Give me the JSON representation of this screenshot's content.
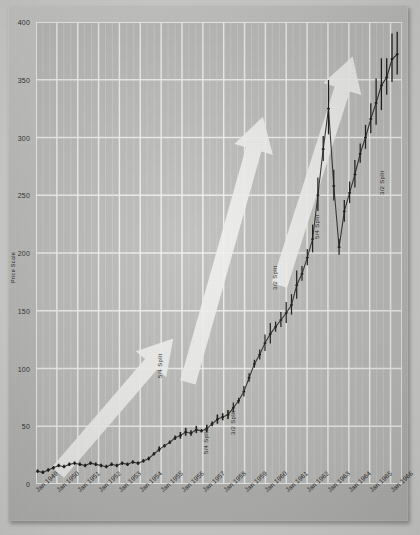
{
  "chart_data": {
    "type": "line",
    "title": "",
    "subtitle": "",
    "xlabel": "",
    "ylabel": "Price Scale",
    "ylim": [
      0,
      400
    ],
    "xlim": [
      "Jan 1949",
      "Jan 1966"
    ],
    "grid": true,
    "legend": "none",
    "y_ticks": [
      0,
      50,
      100,
      150,
      200,
      250,
      300,
      350,
      400
    ],
    "y_tick_labels": [
      "0",
      "50",
      "100",
      "150",
      "200",
      "250",
      "300",
      "350",
      "400"
    ],
    "x_ticks": [
      "Jan 1949",
      "Jan 1950",
      "Jan 1951",
      "Jan 1952",
      "Jan 1953",
      "Jan 1954",
      "Jan 1955",
      "Jan 1956",
      "Jan 1957",
      "Jan 1958",
      "Jan 1959",
      "Jan 1960",
      "Jan 1961",
      "Jan 1962",
      "Jan 1963",
      "Jan 1964",
      "Jan 1965",
      "Jan 1966"
    ],
    "annotations": [
      {
        "text": "5/4 Split",
        "x_frac": 0.33,
        "y_frac": 0.77,
        "rotation": -90
      },
      {
        "text": "5/4 Split",
        "x_frac": 0.455,
        "y_frac": 0.935,
        "rotation": -90
      },
      {
        "text": "3/2 Split",
        "x_frac": 0.53,
        "y_frac": 0.895,
        "rotation": -90
      },
      {
        "text": "3/2 Split",
        "x_frac": 0.645,
        "y_frac": 0.58,
        "rotation": -90
      },
      {
        "text": "5/4 Split",
        "x_frac": 0.76,
        "y_frac": 0.47,
        "rotation": -90
      },
      {
        "text": "3/2 Split",
        "x_frac": 0.938,
        "y_frac": 0.375,
        "rotation": -90
      }
    ],
    "overlays": [
      {
        "name": "trend-arrow-1",
        "shape": "arrow",
        "color": "#f2f2f0",
        "from_frac": [
          0.06,
          0.975
        ],
        "to_frac": [
          0.375,
          0.685
        ]
      },
      {
        "name": "trend-arrow-2",
        "shape": "arrow",
        "color": "#f2f2f0",
        "from_frac": [
          0.415,
          0.78
        ],
        "to_frac": [
          0.62,
          0.205
        ]
      },
      {
        "name": "trend-arrow-3",
        "shape": "arrow",
        "color": "#f2f2f0",
        "from_frac": [
          0.665,
          0.57
        ],
        "to_frac": [
          0.865,
          0.075
        ]
      }
    ],
    "series": [
      {
        "name": "Price",
        "style": "ohlc-bars",
        "color": "#141414",
        "x": [
          "Jan 1949",
          "Apr 1949",
          "Jul 1949",
          "Oct 1949",
          "Jan 1950",
          "Apr 1950",
          "Jul 1950",
          "Oct 1950",
          "Jan 1951",
          "Apr 1951",
          "Jul 1951",
          "Oct 1951",
          "Jan 1952",
          "Apr 1952",
          "Jul 1952",
          "Oct 1952",
          "Jan 1953",
          "Apr 1953",
          "Jul 1953",
          "Oct 1953",
          "Jan 1954",
          "Apr 1954",
          "Jul 1954",
          "Oct 1954",
          "Jan 1955",
          "Apr 1955",
          "Jul 1955",
          "Oct 1955",
          "Jan 1956",
          "Apr 1956",
          "Jul 1956",
          "Oct 1956",
          "Jan 1957",
          "Apr 1957",
          "Jul 1957",
          "Oct 1957",
          "Jan 1958",
          "Apr 1958",
          "Jul 1958",
          "Oct 1958",
          "Jan 1959",
          "Apr 1959",
          "Jul 1959",
          "Oct 1959",
          "Jan 1960",
          "Apr 1960",
          "Jul 1960",
          "Oct 1960",
          "Jan 1961",
          "Apr 1961",
          "Jul 1961",
          "Oct 1961",
          "Jan 1962",
          "Apr 1962",
          "Jul 1962",
          "Oct 1962",
          "Jan 1963",
          "Apr 1963",
          "Jul 1963",
          "Oct 1963",
          "Jan 1964",
          "Apr 1964",
          "Jul 1964",
          "Oct 1964",
          "Jan 1965",
          "Apr 1965",
          "Jul 1965",
          "Oct 1965",
          "Jan 1966"
        ],
        "values": [
          11,
          10,
          12,
          14,
          16,
          15,
          17,
          18,
          17,
          16,
          18,
          17,
          16,
          15,
          17,
          16,
          18,
          17,
          19,
          18,
          20,
          22,
          26,
          30,
          33,
          36,
          40,
          42,
          45,
          44,
          47,
          46,
          48,
          52,
          56,
          58,
          60,
          66,
          72,
          80,
          92,
          104,
          112,
          122,
          130,
          136,
          142,
          148,
          155,
          172,
          182,
          196,
          212,
          250,
          290,
          325,
          258,
          205,
          236,
          252,
          268,
          286,
          300,
          316,
          330,
          345,
          352,
          368,
          372
        ]
      }
    ]
  },
  "axis": {
    "y_title": "Price Scale"
  }
}
